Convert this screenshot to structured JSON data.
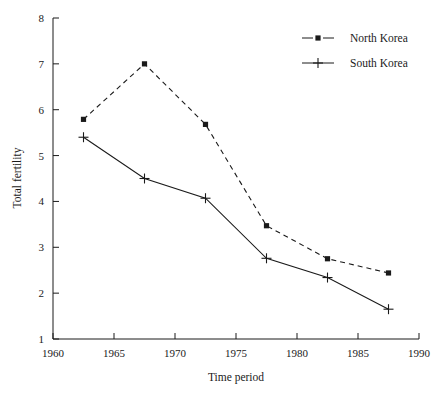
{
  "chart_data": {
    "type": "line",
    "title": "",
    "subtitle": "",
    "xlabel": "Time period",
    "ylabel": "Total fertility",
    "xlim": [
      1960,
      1990
    ],
    "ylim": [
      1,
      8
    ],
    "xticks": [
      1960,
      1965,
      1970,
      1975,
      1980,
      1985,
      1990
    ],
    "xtick_labels": [
      "1960",
      "1965",
      "1970",
      "1975",
      "1980",
      "1985",
      "1990"
    ],
    "yticks": [
      1,
      2,
      3,
      4,
      5,
      6,
      7,
      8
    ],
    "ytick_labels": [
      "1",
      "2",
      "3",
      "4",
      "5",
      "6",
      "7",
      "8"
    ],
    "grid": false,
    "legend_position": "top-right",
    "x": [
      1962.5,
      1967.5,
      1972.5,
      1977.5,
      1982.5,
      1987.5
    ],
    "series": [
      {
        "name": "North Korea",
        "marker": "filled-square",
        "linestyle": "dashed",
        "color": "#1a1a1a",
        "values": [
          5.79,
          7.0,
          5.68,
          3.47,
          2.75,
          2.44
        ]
      },
      {
        "name": "South Korea",
        "marker": "plus-cross",
        "linestyle": "solid",
        "color": "#1a1a1a",
        "values": [
          5.4,
          4.5,
          4.07,
          2.76,
          2.34,
          1.65
        ]
      }
    ],
    "annotations": []
  },
  "legend": {
    "entries": [
      {
        "label": "North Korea",
        "marker": "filled-square",
        "linestyle": "dashed"
      },
      {
        "label": "South Korea",
        "marker": "plus-cross",
        "linestyle": "solid"
      }
    ]
  },
  "axes": {
    "y_axis_title": "Total fertility",
    "x_axis_title": "Time period"
  }
}
